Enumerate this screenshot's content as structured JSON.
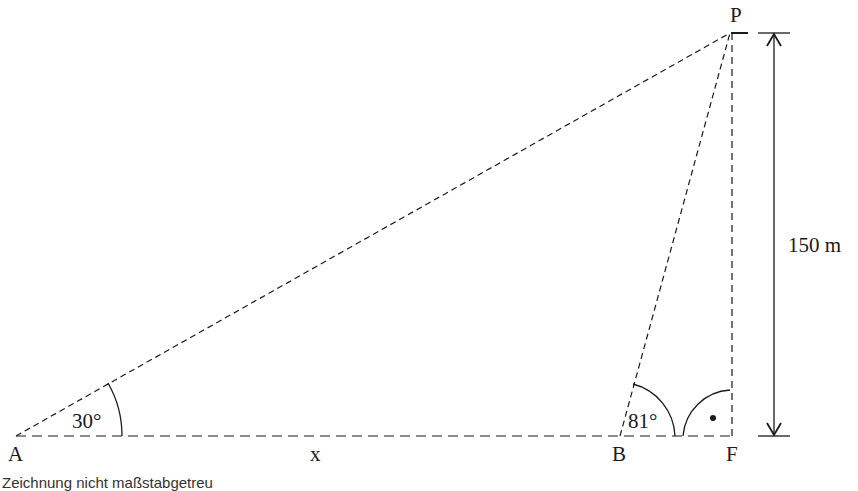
{
  "diagram": {
    "points": {
      "A": {
        "label": "A",
        "x": 16,
        "y": 436
      },
      "B": {
        "label": "B",
        "x": 620,
        "y": 436
      },
      "F": {
        "label": "F",
        "x": 732,
        "y": 436
      },
      "P": {
        "label": "P",
        "x": 732,
        "y": 32
      }
    },
    "angles": {
      "A": "30°",
      "B": "81°",
      "F_right_angle_marker": "•"
    },
    "segments": {
      "AB": "x",
      "PF_height": "150 m"
    },
    "colors": {
      "stroke": "#1a1a1a",
      "background": "#ffffff"
    }
  },
  "caption": "Zeichnung nicht maßstabgetreu"
}
